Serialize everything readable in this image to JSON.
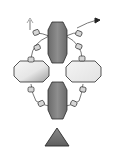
{
  "diagram": {
    "title": "",
    "colors": {
      "background": "#ffffff",
      "dark_subunit": "#7a7a7a",
      "dark_subunit_highlight": "#9a9a9a",
      "light_subunit": "#f2f2f2",
      "light_subunit_shade": "#bdbdbd",
      "outline": "#2b2b2b",
      "linker": "#555555",
      "bead": "#d8d8d8",
      "arrow_dark": "#222222",
      "arrow_light": "#9a9a9a",
      "triangle": "#6e6e6e"
    },
    "elements": [
      {
        "id": "top-dark-subunit",
        "shape": "octagon-vertical"
      },
      {
        "id": "bottom-dark-subunit",
        "shape": "octagon-vertical"
      },
      {
        "id": "left-light-subunit",
        "shape": "octagon-horizontal"
      },
      {
        "id": "right-light-subunit",
        "shape": "octagon-horizontal"
      },
      {
        "id": "bead-linkers",
        "shape": "chain-of-cylinders",
        "count": 12
      },
      {
        "id": "arrow-left-light",
        "shape": "arrow"
      },
      {
        "id": "arrow-right-dark",
        "shape": "arrow"
      },
      {
        "id": "ligand-triangle",
        "shape": "triangle"
      }
    ]
  }
}
